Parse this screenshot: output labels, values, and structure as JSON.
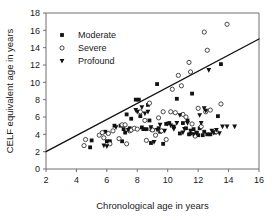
{
  "chart_data": {
    "type": "scatter",
    "title": "",
    "xlabel": "Chronological age in years",
    "ylabel": "CELF equivalent age in years",
    "xlim": [
      2,
      16
    ],
    "ylim": [
      0,
      18
    ],
    "xticks": [
      2,
      4,
      6,
      8,
      10,
      12,
      14,
      16
    ],
    "yticks": [
      0,
      2,
      4,
      6,
      8,
      10,
      12,
      14,
      16,
      18
    ],
    "grid": false,
    "legend_position": "upper-left-inside",
    "legend": [
      "Moderate",
      "Severe",
      "Profound"
    ],
    "markers": {
      "Moderate": "filled-square",
      "Severe": "open-circle",
      "Profound": "filled-down-triangle"
    },
    "annotations": [
      {
        "kind": "reference-line",
        "label": "regression line",
        "x": [
          2,
          16
        ],
        "y": [
          2,
          15
        ]
      }
    ],
    "series": [
      {
        "name": "Moderate",
        "marker": "filled-square",
        "color": "#121212",
        "points": [
          [
            4.9,
            2.5
          ],
          [
            5.0,
            3.3
          ],
          [
            5.9,
            4.3
          ],
          [
            6.0,
            3.2
          ],
          [
            6.2,
            3.2
          ],
          [
            6.5,
            5.0
          ],
          [
            6.9,
            5.0
          ],
          [
            7.0,
            3.2
          ],
          [
            7.1,
            4.6
          ],
          [
            7.2,
            4.2
          ],
          [
            7.3,
            6.3
          ],
          [
            7.5,
            4.7
          ],
          [
            7.6,
            5.8
          ],
          [
            7.9,
            8.0
          ],
          [
            8.1,
            8.0
          ],
          [
            8.2,
            6.1
          ],
          [
            8.3,
            4.8
          ],
          [
            8.4,
            4.6
          ],
          [
            8.6,
            4.6
          ],
          [
            8.7,
            7.4
          ],
          [
            8.8,
            5.6
          ],
          [
            8.9,
            3.0
          ],
          [
            9.0,
            4.5
          ],
          [
            9.3,
            9.8
          ],
          [
            9.4,
            4.7
          ],
          [
            9.5,
            4.3
          ],
          [
            9.7,
            2.9
          ],
          [
            9.9,
            5.2
          ],
          [
            10.1,
            5.3
          ],
          [
            10.4,
            4.9
          ],
          [
            10.6,
            8.1
          ],
          [
            10.8,
            4.1
          ],
          [
            11.0,
            5.3
          ],
          [
            11.2,
            4.7
          ],
          [
            11.3,
            5.6
          ],
          [
            11.4,
            4.0
          ],
          [
            11.5,
            4.1
          ],
          [
            11.6,
            8.7
          ],
          [
            11.7,
            4.6
          ],
          [
            11.9,
            4.2
          ],
          [
            12.0,
            3.9
          ],
          [
            12.1,
            4.7
          ],
          [
            12.3,
            3.9
          ],
          [
            12.4,
            4.3
          ],
          [
            12.6,
            4.0
          ],
          [
            12.8,
            4.0
          ],
          [
            13.1,
            4.2
          ],
          [
            13.3,
            6.1
          ],
          [
            13.5,
            12.1
          ]
        ]
      },
      {
        "name": "Severe",
        "marker": "open-circle",
        "color": "#ffffff",
        "points": [
          [
            4.5,
            2.7
          ],
          [
            4.6,
            3.4
          ],
          [
            5.5,
            3.9
          ],
          [
            5.7,
            4.2
          ],
          [
            5.8,
            3.6
          ],
          [
            6.1,
            4.1
          ],
          [
            6.2,
            2.9
          ],
          [
            6.4,
            4.4
          ],
          [
            6.8,
            3.5
          ],
          [
            7.0,
            5.1
          ],
          [
            7.2,
            5.1
          ],
          [
            7.3,
            2.9
          ],
          [
            7.5,
            4.4
          ],
          [
            7.6,
            4.5
          ],
          [
            7.8,
            4.7
          ],
          [
            8.0,
            4.6
          ],
          [
            8.2,
            6.6
          ],
          [
            8.5,
            5.6
          ],
          [
            8.6,
            3.3
          ],
          [
            8.8,
            7.6
          ],
          [
            8.9,
            4.6
          ],
          [
            9.0,
            4.5
          ],
          [
            9.2,
            3.9
          ],
          [
            9.4,
            5.9
          ],
          [
            9.6,
            4.4
          ],
          [
            9.7,
            6.6
          ],
          [
            9.9,
            3.4
          ],
          [
            10.2,
            6.6
          ],
          [
            10.3,
            9.2
          ],
          [
            10.5,
            6.5
          ],
          [
            10.7,
            10.8
          ],
          [
            10.9,
            9.6
          ],
          [
            11.0,
            6.3
          ],
          [
            11.2,
            6.0
          ],
          [
            11.4,
            12.3
          ],
          [
            11.5,
            11.2
          ],
          [
            11.6,
            5.2
          ],
          [
            11.8,
            3.8
          ],
          [
            12.0,
            7.0
          ],
          [
            12.2,
            4.9
          ],
          [
            12.4,
            15.8
          ],
          [
            12.5,
            6.6
          ],
          [
            12.6,
            13.7
          ],
          [
            12.8,
            6.8
          ],
          [
            13.2,
            4.3
          ],
          [
            13.5,
            7.5
          ],
          [
            13.9,
            16.7
          ]
        ]
      },
      {
        "name": "Profound",
        "marker": "filled-down-triangle",
        "color": "#121212",
        "points": [
          [
            5.8,
            2.7
          ],
          [
            6.0,
            2.6
          ],
          [
            6.6,
            4.8
          ],
          [
            7.4,
            4.5
          ],
          [
            7.9,
            6.8
          ],
          [
            8.0,
            6.6
          ],
          [
            8.3,
            7.1
          ],
          [
            8.5,
            6.4
          ],
          [
            8.7,
            6.6
          ],
          [
            8.9,
            4.8
          ],
          [
            9.1,
            3.1
          ],
          [
            9.3,
            4.5
          ],
          [
            9.5,
            5.1
          ],
          [
            9.8,
            4.4
          ],
          [
            10.0,
            5.2
          ],
          [
            10.2,
            5.0
          ],
          [
            10.4,
            4.6
          ],
          [
            10.6,
            5.3
          ],
          [
            10.8,
            6.2
          ],
          [
            11.0,
            4.2
          ],
          [
            11.1,
            4.6
          ],
          [
            11.3,
            5.3
          ],
          [
            11.5,
            4.4
          ],
          [
            11.7,
            4.0
          ],
          [
            11.9,
            4.1
          ],
          [
            12.1,
            6.2
          ],
          [
            12.2,
            5.3
          ],
          [
            12.4,
            7.0
          ],
          [
            12.5,
            6.7
          ],
          [
            12.7,
            11.4
          ],
          [
            12.9,
            4.4
          ],
          [
            13.0,
            4.2
          ],
          [
            13.2,
            4.5
          ],
          [
            13.4,
            4.1
          ],
          [
            13.6,
            4.9
          ],
          [
            13.9,
            4.9
          ],
          [
            14.4,
            4.9
          ]
        ]
      }
    ]
  }
}
